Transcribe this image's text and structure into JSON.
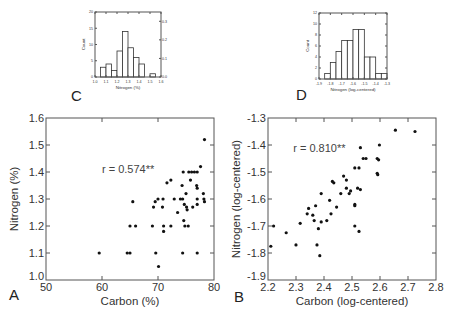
{
  "chart_data": [
    {
      "id": "C",
      "panel_label": "C",
      "type": "bar",
      "subtype": "histogram",
      "title": "",
      "xlabel": "Nitrogen (%)",
      "ylabel": "Count",
      "bin_edges": [
        1.0,
        1.05,
        1.1,
        1.15,
        1.2,
        1.25,
        1.3,
        1.35,
        1.4,
        1.45,
        1.5,
        1.55
      ],
      "values": [
        0,
        3,
        4,
        2,
        8,
        14,
        9,
        6,
        4,
        0,
        1
      ],
      "xlim": [
        1.0,
        1.6
      ],
      "ylim": [
        0,
        20
      ],
      "xticks": [
        "1.0",
        "1.1",
        "1.2",
        "1.3",
        "1.4",
        "1.5",
        "1.6"
      ],
      "yticks": [
        "0",
        "5",
        "10",
        "15",
        "20"
      ],
      "y2ticks": [
        "0.0",
        "0.1",
        "0.2",
        "0.3"
      ],
      "y2lim": [
        0,
        0.35
      ],
      "grid": false,
      "frame": {
        "x": 95,
        "y": 12,
        "w": 66,
        "h": 65
      }
    },
    {
      "id": "D",
      "panel_label": "D",
      "type": "bar",
      "subtype": "histogram",
      "title": "",
      "xlabel": "Nitrogen (log-centered)",
      "ylabel": "Count",
      "bin_edges": [
        -1.9,
        -1.85,
        -1.8,
        -1.75,
        -1.7,
        -1.65,
        -1.6,
        -1.55,
        -1.5,
        -1.45,
        -1.4,
        -1.35,
        -1.3
      ],
      "values": [
        0,
        1,
        3,
        5,
        7,
        7,
        9,
        9,
        4,
        4,
        1,
        1
      ],
      "xlim": [
        -1.9,
        -1.3
      ],
      "ylim": [
        0,
        12
      ],
      "xticks": [
        "-1.9",
        "-1.8",
        "-1.7",
        "-1.6",
        "-1.5",
        "-1.4",
        "-1.3"
      ],
      "yticks": [
        "0",
        "2",
        "4",
        "6",
        "8",
        "10",
        "12"
      ],
      "grid": false,
      "frame": {
        "x": 319,
        "y": 13,
        "w": 68,
        "h": 66
      }
    },
    {
      "id": "A",
      "panel_label": "A",
      "type": "scatter",
      "title": "",
      "xlabel": "Carbon (%)",
      "ylabel": "Nitrogen (%)",
      "annotation": "r = 0.574**",
      "annotation_pos": {
        "x": 60,
        "y": 1.41
      },
      "xlim": [
        50,
        80
      ],
      "ylim": [
        1.0,
        1.6
      ],
      "xticks": [
        "50",
        "60",
        "70",
        "80"
      ],
      "yticks": [
        "1.0",
        "1.1",
        "1.2",
        "1.3",
        "1.4",
        "1.5",
        "1.6"
      ],
      "grid": false,
      "frame": {
        "x": 46,
        "y": 118,
        "w": 168,
        "h": 162
      },
      "points": [
        [
          59.5,
          1.1
        ],
        [
          64.5,
          1.1
        ],
        [
          65.0,
          1.1
        ],
        [
          65.0,
          1.2
        ],
        [
          65.5,
          1.29
        ],
        [
          66.0,
          1.2
        ],
        [
          69.0,
          1.2
        ],
        [
          69.2,
          1.27
        ],
        [
          69.5,
          1.29
        ],
        [
          69.6,
          1.1
        ],
        [
          70.0,
          1.3
        ],
        [
          70.1,
          1.05
        ],
        [
          70.8,
          1.27
        ],
        [
          70.9,
          1.3
        ],
        [
          71.0,
          1.18
        ],
        [
          71.0,
          1.2
        ],
        [
          71.6,
          1.36
        ],
        [
          72.3,
          1.37
        ],
        [
          72.3,
          1.2
        ],
        [
          72.9,
          1.3
        ],
        [
          73.5,
          1.25
        ],
        [
          74.0,
          1.3
        ],
        [
          74.3,
          1.35
        ],
        [
          74.4,
          1.3
        ],
        [
          74.5,
          1.4
        ],
        [
          74.4,
          1.1
        ],
        [
          74.6,
          1.22
        ],
        [
          74.7,
          1.28
        ],
        [
          74.8,
          1.2
        ],
        [
          75.0,
          1.32
        ],
        [
          75.1,
          1.27
        ],
        [
          75.2,
          1.26
        ],
        [
          75.4,
          1.2
        ],
        [
          75.5,
          1.4
        ],
        [
          75.8,
          1.37
        ],
        [
          76.0,
          1.4
        ],
        [
          76.2,
          1.27
        ],
        [
          76.5,
          1.4
        ],
        [
          77.0,
          1.4
        ],
        [
          76.9,
          1.35
        ],
        [
          77.0,
          1.34
        ],
        [
          77.0,
          1.3
        ],
        [
          77.0,
          1.28
        ],
        [
          77.0,
          1.1
        ],
        [
          77.6,
          1.42
        ],
        [
          78.1,
          1.32
        ],
        [
          78.2,
          1.3
        ],
        [
          78.3,
          1.29
        ],
        [
          78.3,
          1.52
        ]
      ]
    },
    {
      "id": "B",
      "panel_label": "B",
      "type": "scatter",
      "title": "",
      "xlabel": "Carbon (log-centered)",
      "ylabel": "Nitrogen (log-centered)",
      "annotation": "r = 0.810**",
      "annotation_pos": {
        "x": 2.29,
        "y": -1.41
      },
      "xlim": [
        2.2,
        2.8
      ],
      "ylim": [
        -1.9,
        -1.3
      ],
      "xticks": [
        "2.2",
        "2.3",
        "2.4",
        "2.5",
        "2.6",
        "2.7",
        "2.8"
      ],
      "yticks": [
        "-1.3",
        "-1.4",
        "-1.5",
        "-1.6",
        "-1.7",
        "-1.8",
        "-1.9"
      ],
      "grid": false,
      "frame": {
        "x": 268,
        "y": 118,
        "w": 168,
        "h": 162
      },
      "points": [
        [
          2.21,
          -1.775
        ],
        [
          2.22,
          -1.7
        ],
        [
          2.265,
          -1.725
        ],
        [
          2.3,
          -1.77
        ],
        [
          2.315,
          -1.69
        ],
        [
          2.34,
          -1.655
        ],
        [
          2.345,
          -1.635
        ],
        [
          2.36,
          -1.66
        ],
        [
          2.365,
          -1.68
        ],
        [
          2.37,
          -1.625
        ],
        [
          2.375,
          -1.77
        ],
        [
          2.38,
          -1.71
        ],
        [
          2.385,
          -1.81
        ],
        [
          2.39,
          -1.58
        ],
        [
          2.39,
          -1.685
        ],
        [
          2.41,
          -1.68
        ],
        [
          2.42,
          -1.605
        ],
        [
          2.425,
          -1.655
        ],
        [
          2.43,
          -1.535
        ],
        [
          2.435,
          -1.54
        ],
        [
          2.445,
          -1.63
        ],
        [
          2.46,
          -1.58
        ],
        [
          2.47,
          -1.515
        ],
        [
          2.48,
          -1.56
        ],
        [
          2.48,
          -1.53
        ],
        [
          2.49,
          -1.58
        ],
        [
          2.495,
          -1.57
        ],
        [
          2.51,
          -1.485
        ],
        [
          2.51,
          -1.62
        ],
        [
          2.51,
          -1.625
        ],
        [
          2.51,
          -1.7
        ],
        [
          2.52,
          -1.56
        ],
        [
          2.525,
          -1.72
        ],
        [
          2.525,
          -1.485
        ],
        [
          2.53,
          -1.565
        ],
        [
          2.53,
          -1.41
        ],
        [
          2.54,
          -1.45
        ],
        [
          2.55,
          -1.45
        ],
        [
          2.59,
          -1.45
        ],
        [
          2.59,
          -1.505
        ],
        [
          2.592,
          -1.51
        ],
        [
          2.595,
          -1.455
        ],
        [
          2.598,
          -1.4
        ],
        [
          2.655,
          -1.345
        ],
        [
          2.725,
          -1.35
        ]
      ]
    }
  ]
}
